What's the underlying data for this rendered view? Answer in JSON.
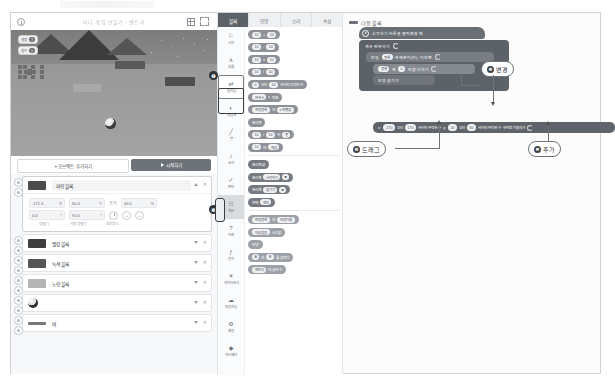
{
  "window": {
    "title": "미니 게임 만들기 - 엔트리"
  },
  "stage": {
    "header_title": "미니 게임 만들기 - 엔트리",
    "icons": {
      "info": "info-icon",
      "grid": "grid-icon",
      "fullscreen": "fullscreen-icon"
    },
    "variables": [
      {
        "name": "생명",
        "value": "3"
      },
      {
        "name": "점수",
        "value": "0"
      }
    ]
  },
  "controls": {
    "add_object": "+ 오브젝트 추가하기",
    "start": "시작하기"
  },
  "object_panel": {
    "mini_tools": [
      "오브젝트",
      "도움말",
      "그림"
    ],
    "selected": {
      "name": "파랑 블록",
      "props": {
        "x_label": "X",
        "x": "-171.3",
        "y_label": "Y",
        "y": "60.4",
        "size_label": "크기",
        "size": "40.0",
        "size_unit": "%",
        "direction_label": "방향(°)",
        "direction": "0.0",
        "move_direction_label": "이동 방향(°)",
        "move_direction": "90.0",
        "rotation_label": "회전방식"
      }
    },
    "objects": [
      {
        "name": "빨강 블록",
        "type": "brick"
      },
      {
        "name": "녹색 블록",
        "type": "brick"
      },
      {
        "name": "노랑 블록",
        "type": "brick"
      },
      {
        "name": "공",
        "type": "ball"
      },
      {
        "name": "바",
        "type": "bar"
      }
    ]
  },
  "palette": {
    "tabs": [
      {
        "label": "블록",
        "active": true
      },
      {
        "label": "모양",
        "active": false
      },
      {
        "label": "소리",
        "active": false
      },
      {
        "label": "속성",
        "active": false
      }
    ],
    "categories": [
      {
        "label": "시작",
        "icon": "flag-icon"
      },
      {
        "label": "흐름",
        "icon": "flow-icon"
      },
      {
        "label": "움직임",
        "icon": "move-icon",
        "selected": true
      },
      {
        "label": "생김새",
        "icon": "look-icon"
      },
      {
        "label": "붓",
        "icon": "brush-icon"
      },
      {
        "label": "소리",
        "icon": "sound-icon"
      },
      {
        "label": "판단",
        "icon": "judge-icon"
      },
      {
        "label": "계산",
        "icon": "calc-icon",
        "highlighted": true
      },
      {
        "label": "자료",
        "icon": "data-icon"
      },
      {
        "label": "함수",
        "icon": "function-icon"
      },
      {
        "label": "데이터분석",
        "icon": "analysis-icon"
      },
      {
        "label": "인공지능",
        "icon": "ai-icon"
      },
      {
        "label": "확장",
        "icon": "extension-icon"
      },
      {
        "label": "하드웨어",
        "icon": "hardware-icon"
      }
    ],
    "blocks": [
      {
        "parts": [
          "10",
          "+",
          "10"
        ],
        "style": "calc"
      },
      {
        "parts": [
          "10",
          "-",
          "10"
        ],
        "style": "calc"
      },
      {
        "parts": [
          "10",
          "x",
          "10"
        ],
        "style": "calc"
      },
      {
        "parts": [
          "10",
          "/",
          "10"
        ],
        "style": "calc"
      },
      {
        "parts": [
          "0",
          "부터",
          "10",
          "사이의 무작위 수"
        ],
        "style": "calc"
      },
      {
        "parts": [
          "마우스",
          "x",
          "좌표"
        ],
        "style": "calc"
      },
      {
        "parts": [
          "파랑 블록",
          "의",
          "x 좌푯값"
        ],
        "style": "calc"
      },
      {
        "parts": [
          "초시계"
        ],
        "style": "calc"
      },
      {
        "parts": [
          "10",
          "/",
          "10",
          "의",
          "몫"
        ],
        "style": "calc"
      },
      {
        "parts": [
          "10",
          "의",
          "제곱"
        ],
        "style": "calc"
      },
      {
        "parts": [
          "초시계 값"
        ],
        "style": "dark"
      },
      {
        "parts": [
          "초시계",
          "시작하기"
        ],
        "style": "dark"
      },
      {
        "parts": [
          "초시계",
          "숨기기"
        ],
        "style": "dark"
      },
      {
        "parts": [
          "현재",
          "연도"
        ],
        "style": "dark"
      },
      {
        "parts": [
          "파랑 블록",
          "의",
          "모양 이름"
        ],
        "style": "mid"
      },
      {
        "parts": [
          "대상 없음",
          "소리값"
        ],
        "style": "mid"
      },
      {
        "parts": [
          "안녕!"
        ],
        "style": "mid"
      },
      {
        "parts": [
          "A",
          "와",
          "B",
          "를 합치기"
        ],
        "style": "mid"
      },
      {
        "parts": [
          "엔트리",
          "의 글자 수"
        ],
        "style": "mid"
      }
    ]
  },
  "workspace": {
    "title": "다음 블록",
    "script": {
      "hat": "시작하기 버튼을 클릭했을 때",
      "loop": "계속 반복하기",
      "inner": [
        {
          "text_before": "만일",
          "dropdown": "블록",
          "text_after": "복제본이(가)",
          "tail": "이라면"
        },
        {
          "dropdown": "블록",
          "text_mid": "에",
          "value": "0",
          "text_after": "만큼 더하기"
        },
        {
          "text": "모양 숨기기"
        }
      ],
      "wide": {
        "label_x": "x:",
        "x_from": "-170",
        "text1": "부터",
        "x_to": "170",
        "text2": "사이의 무작위 수",
        "label_y": "y:",
        "y_from": "20",
        "text3": "부터",
        "y_to": "60",
        "text4": "사이의 무작위 수",
        "text5": "위치로 이동하기"
      }
    }
  },
  "callouts": [
    {
      "num": "❶",
      "label": "",
      "target": "stage-panel-divider"
    },
    {
      "num": "❷",
      "label": "추가",
      "target": "random-position-block"
    },
    {
      "num": "❸",
      "label": "",
      "target": "object-properties"
    },
    {
      "num": "❹",
      "label": "드래그",
      "target": "move-to-random-block"
    },
    {
      "num": "❺",
      "label": "변경",
      "target": "random-number-operand"
    }
  ],
  "colors": {
    "accent_dark": "#5d6268",
    "block_calc": "#8e9298",
    "panel_bg": "#f7f8f9",
    "border": "#e2e5e8"
  }
}
